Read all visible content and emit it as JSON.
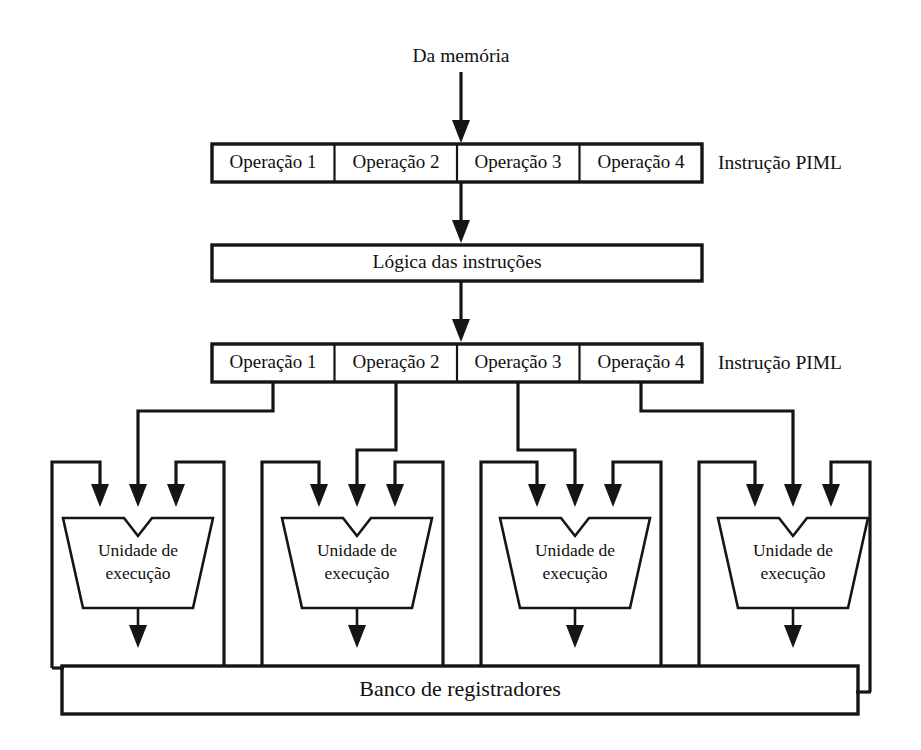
{
  "figure": {
    "background_color": "#ffffff",
    "line_color": "#151515"
  },
  "source": {
    "label": "Da memória"
  },
  "instruction_word_top": {
    "side_label": "Instrução PIML",
    "cells": [
      {
        "label": "Operação 1"
      },
      {
        "label": "Operação 2"
      },
      {
        "label": "Operação 3"
      },
      {
        "label": "Operação 4"
      }
    ]
  },
  "decode": {
    "label": "Lógica das instruções"
  },
  "instruction_word_bottom": {
    "side_label": "Instrução PIML",
    "cells": [
      {
        "label": "Operação 1"
      },
      {
        "label": "Operação 2"
      },
      {
        "label": "Operação 3"
      },
      {
        "label": "Operação 4"
      }
    ]
  },
  "execution_units": [
    {
      "line1": "Unidade de",
      "line2": "execução"
    },
    {
      "line1": "Unidade de",
      "line2": "execução"
    },
    {
      "line1": "Unidade de",
      "line2": "execução"
    },
    {
      "line1": "Unidade de",
      "line2": "execução"
    }
  ],
  "register_file": {
    "label": "Banco de registradores"
  }
}
